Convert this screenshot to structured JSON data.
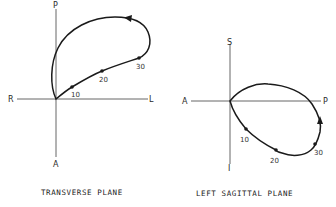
{
  "figure": {
    "panels": [
      {
        "id": "transverse",
        "title": "TRANSVERSE PLANE",
        "axes": {
          "top": "P",
          "bottom": "A",
          "left": "R",
          "right": "L"
        },
        "time_markers": [
          {
            "label": "10"
          },
          {
            "label": "20"
          },
          {
            "label": "30"
          }
        ],
        "direction": "counterclockwise loop from origin toward L/P, returning via P axis"
      },
      {
        "id": "left-sagittal",
        "title": "LEFT SAGITTAL PLANE",
        "axes": {
          "top": "S",
          "bottom": "I",
          "left": "A",
          "right": "P"
        },
        "time_markers": [
          {
            "label": "10"
          },
          {
            "label": "20"
          },
          {
            "label": "30"
          }
        ],
        "direction": "loop from origin downward/inferior, sweeping posterior, returning over top"
      }
    ],
    "colors": {
      "line": "#1a1a1a",
      "axis": "#555555",
      "background": "#ffffff"
    }
  }
}
